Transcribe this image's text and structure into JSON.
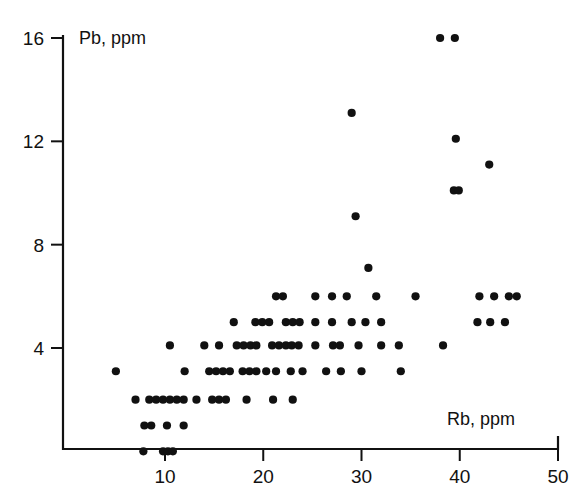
{
  "figure": {
    "background_color": "#ffffff",
    "ink_color": "#111111",
    "width": 585,
    "height": 503
  },
  "axes": {
    "y_title": "Pb, ppm",
    "x_title": "Rb, ppm",
    "x_ticks": [
      "10",
      "20",
      "30",
      "40",
      "50"
    ],
    "y_ticks": [
      "4",
      "8",
      "12",
      "16"
    ]
  },
  "caption": {
    "partial_text": ""
  },
  "chart_data": {
    "type": "scatter",
    "title": "",
    "xlabel": "Rb, ppm",
    "ylabel": "Pb, ppm",
    "xlim": [
      3,
      50
    ],
    "ylim": [
      0,
      17
    ],
    "x_ticks": [
      10,
      20,
      30,
      40,
      50
    ],
    "y_ticks": [
      4,
      8,
      12,
      16
    ],
    "grid": false,
    "legend": false,
    "marker": "filled-circle",
    "marker_color": "#111111",
    "marker_size_px": 5,
    "points": [
      [
        38.0,
        16.0
      ],
      [
        39.5,
        16.0
      ],
      [
        29.0,
        13.1
      ],
      [
        39.6,
        12.1
      ],
      [
        43.0,
        11.1
      ],
      [
        39.4,
        10.1
      ],
      [
        39.9,
        10.1
      ],
      [
        29.4,
        9.1
      ],
      [
        30.7,
        7.1
      ],
      [
        21.3,
        6.0
      ],
      [
        22.0,
        6.0
      ],
      [
        25.3,
        6.0
      ],
      [
        27.0,
        6.0
      ],
      [
        28.5,
        6.0
      ],
      [
        31.5,
        6.0
      ],
      [
        35.5,
        6.0
      ],
      [
        42.0,
        6.0
      ],
      [
        43.5,
        6.0
      ],
      [
        45.0,
        6.0
      ],
      [
        45.8,
        6.0
      ],
      [
        17.0,
        5.0
      ],
      [
        19.2,
        5.0
      ],
      [
        19.9,
        5.0
      ],
      [
        20.6,
        5.0
      ],
      [
        22.3,
        5.0
      ],
      [
        23.0,
        5.0
      ],
      [
        23.7,
        5.0
      ],
      [
        25.3,
        5.0
      ],
      [
        27.0,
        5.0
      ],
      [
        29.0,
        5.0
      ],
      [
        30.4,
        5.0
      ],
      [
        32.0,
        5.0
      ],
      [
        41.8,
        5.0
      ],
      [
        43.1,
        5.0
      ],
      [
        44.6,
        5.0
      ],
      [
        10.5,
        4.1
      ],
      [
        14.0,
        4.1
      ],
      [
        15.5,
        4.1
      ],
      [
        17.3,
        4.1
      ],
      [
        18.0,
        4.1
      ],
      [
        18.7,
        4.1
      ],
      [
        19.3,
        4.1
      ],
      [
        20.9,
        4.1
      ],
      [
        21.6,
        4.1
      ],
      [
        22.3,
        4.1
      ],
      [
        22.9,
        4.1
      ],
      [
        23.6,
        4.1
      ],
      [
        25.3,
        4.1
      ],
      [
        27.1,
        4.1
      ],
      [
        27.8,
        4.1
      ],
      [
        29.7,
        4.1
      ],
      [
        32.0,
        4.1
      ],
      [
        33.8,
        4.1
      ],
      [
        38.3,
        4.1
      ],
      [
        12.0,
        3.1
      ],
      [
        14.5,
        3.1
      ],
      [
        15.2,
        3.1
      ],
      [
        15.9,
        3.1
      ],
      [
        16.6,
        3.1
      ],
      [
        17.9,
        3.1
      ],
      [
        18.6,
        3.1
      ],
      [
        19.3,
        3.1
      ],
      [
        20.3,
        3.1
      ],
      [
        21.3,
        3.1
      ],
      [
        22.8,
        3.1
      ],
      [
        24.0,
        3.1
      ],
      [
        26.4,
        3.1
      ],
      [
        27.9,
        3.1
      ],
      [
        30.0,
        3.1
      ],
      [
        34.0,
        3.1
      ],
      [
        5.0,
        3.1
      ],
      [
        7.0,
        2.0
      ],
      [
        8.4,
        2.0
      ],
      [
        9.1,
        2.0
      ],
      [
        9.8,
        2.0
      ],
      [
        10.5,
        2.0
      ],
      [
        11.2,
        2.0
      ],
      [
        11.9,
        2.0
      ],
      [
        13.2,
        2.0
      ],
      [
        14.8,
        2.0
      ],
      [
        15.5,
        2.0
      ],
      [
        16.2,
        2.0
      ],
      [
        18.3,
        2.0
      ],
      [
        21.0,
        2.0
      ],
      [
        23.0,
        2.0
      ],
      [
        7.9,
        1.0
      ],
      [
        8.6,
        1.0
      ],
      [
        10.2,
        1.0
      ],
      [
        11.9,
        1.0
      ],
      [
        7.8,
        0.0
      ],
      [
        9.8,
        0.0
      ],
      [
        10.3,
        0.0
      ],
      [
        10.8,
        0.0
      ]
    ]
  }
}
